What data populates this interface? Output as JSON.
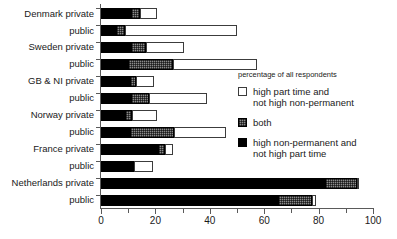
{
  "chart_data": {
    "type": "bar",
    "orientation": "horizontal",
    "stacked": true,
    "title": "",
    "xlabel": "",
    "ylabel": "",
    "xlim": [
      0,
      100
    ],
    "grid": false,
    "xticks": [
      0,
      20,
      40,
      60,
      80,
      100
    ],
    "xticklabels": [
      "0",
      "20",
      "40",
      "60",
      "80",
      "100"
    ],
    "legend_position": "right",
    "legend_title": "percentage of all respondents",
    "series": [
      {
        "name": "high non-permanent and not high part time",
        "key": "black",
        "color": "#000000",
        "values": [
          11,
          5.5,
          11,
          10,
          10.5,
          11,
          9,
          10.5,
          21,
          12,
          82.5,
          65
        ]
      },
      {
        "name": "both",
        "key": "both",
        "color": "#8a8a8a",
        "values": [
          3.5,
          3.5,
          5.5,
          16.5,
          2.5,
          6.5,
          2.5,
          16.5,
          2.5,
          0,
          11.5,
          12.5
        ]
      },
      {
        "name": "high part time and not high non-permanent",
        "key": "white",
        "color": "#ffffff",
        "values": [
          6,
          41,
          14,
          31,
          6.5,
          21.5,
          9,
          19,
          3,
          7,
          1,
          1.5
        ]
      }
    ],
    "categories": [
      "Denmark private",
      "public",
      "Sweden private",
      "public",
      "GB & NI private",
      "public",
      "Norway private",
      "public",
      "France private",
      "public",
      "Netherlands private",
      "public"
    ],
    "category_totals": [
      20.5,
      50,
      30.5,
      57.5,
      19.5,
      39,
      20.5,
      46,
      26.5,
      19,
      95,
      79
    ]
  },
  "legend": {
    "title": "percentage of all respondents",
    "items": [
      {
        "swatch": "white",
        "line1": "high part time and",
        "line2": "not high non-permanent"
      },
      {
        "swatch": "both",
        "line1": "both",
        "line2": ""
      },
      {
        "swatch": "black",
        "line1": "high non-permanent and",
        "line2": "not high part time"
      }
    ]
  }
}
